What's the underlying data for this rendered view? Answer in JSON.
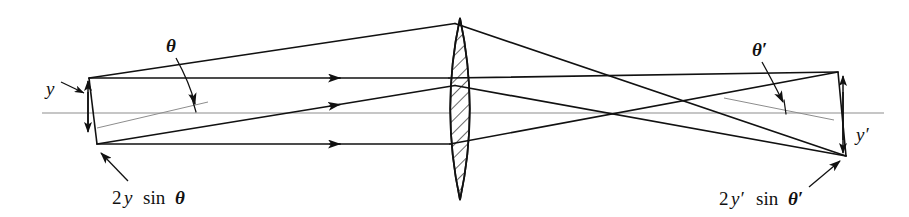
{
  "figure": {
    "domain": "Diagram",
    "width": 909,
    "height": 217,
    "background_color": "#ffffff",
    "line_color": "#111111",
    "axis_color": "#8d8d8d"
  },
  "labels": {
    "theta": "θ",
    "theta_prime": "θ′",
    "y": "y",
    "y_prime": "y′",
    "two_y_sin_theta_num": "2",
    "two_y_sin_theta_var": "y",
    "two_y_sin_theta_fn": "sin",
    "two_y_sin_theta_angle": "θ",
    "two_yp_sin_thetap_num": "2",
    "two_yp_sin_thetap_var": "y′",
    "two_yp_sin_thetap_fn": "sin",
    "two_yp_sin_thetap_angle": "θ′",
    "object_height_full": "2y sin θ",
    "image_height_full": "2y′ sin θ′"
  },
  "geometry": {
    "optical_axis": {
      "x1": 42,
      "y1": 113,
      "x2": 884,
      "y2": 113
    },
    "lens": {
      "center_x": 460,
      "top_y": 18,
      "bottom_y": 200,
      "half_width": 19,
      "hatch_angle_deg": 45,
      "hatch_spacing": 7
    },
    "object": {
      "top_point": {
        "x": 89,
        "y": 78
      },
      "bottom_point": {
        "x": 97,
        "y": 144
      },
      "arrow_x": 88,
      "arrow_top_y": 80,
      "arrow_bottom_y": 133
    },
    "image": {
      "top_point": {
        "x": 838,
        "y": 72
      },
      "bottom_point": {
        "x": 846,
        "y": 156
      },
      "arrow_x": 843,
      "arrow_top_y": 75,
      "arrow_bottom_y": 154
    },
    "crossover": {
      "x": 610,
      "y": 112
    },
    "rays": [
      {
        "name": "ray-top-from-object-top",
        "from": {
          "x": 89,
          "y": 78
        },
        "to_lens": {
          "x": 446,
          "y": 24
        },
        "to_image": {
          "x": 838,
          "y": 72
        }
      },
      {
        "name": "ray-axial-from-object-top",
        "from": {
          "x": 89,
          "y": 78
        },
        "to_lens": {
          "x": 443,
          "y": 78
        },
        "to_image": {
          "x": 846,
          "y": 156
        }
      },
      {
        "name": "ray-tilted-from-object-bottom",
        "from": {
          "x": 97,
          "y": 144
        },
        "to_lens": {
          "x": 447,
          "y": 86
        },
        "to_image": {
          "x": 838,
          "y": 72
        }
      },
      {
        "name": "ray-lower-from-object-bottom",
        "from": {
          "x": 97,
          "y": 144
        },
        "to_lens": {
          "x": 444,
          "y": 144
        },
        "to_image": {
          "x": 846,
          "y": 156
        }
      }
    ],
    "angle_reference_left": {
      "x1": 95,
      "y1": 127,
      "x2": 205,
      "y2": 103
    },
    "angle_reference_right": {
      "x1": 730,
      "y1": 99,
      "x2": 830,
      "y2": 119
    },
    "theta_leader": {
      "from": {
        "x": 177,
        "y": 56
      },
      "to": {
        "x": 196,
        "y": 107
      }
    },
    "theta_prime_leader": {
      "from": {
        "x": 760,
        "y": 60
      },
      "to": {
        "x": 784,
        "y": 105
      }
    },
    "y_leader": {
      "from": {
        "x": 60,
        "y": 83
      },
      "to": {
        "x": 86,
        "y": 94
      }
    },
    "object_dim_leader": {
      "from": {
        "x": 126,
        "y": 180
      },
      "to": {
        "x": 99,
        "y": 152
      }
    },
    "image_dim_leader": {
      "from": {
        "x": 812,
        "y": 185
      },
      "to": {
        "x": 843,
        "y": 160
      }
    }
  },
  "label_positions": {
    "theta": {
      "x": 166,
      "y": 52
    },
    "theta_prime": {
      "x": 752,
      "y": 56
    },
    "y": {
      "x": 47,
      "y": 94
    },
    "y_prime": {
      "x": 856,
      "y": 140
    },
    "object_dim": {
      "x": 112,
      "y": 204
    },
    "image_dim": {
      "x": 719,
      "y": 206
    }
  }
}
